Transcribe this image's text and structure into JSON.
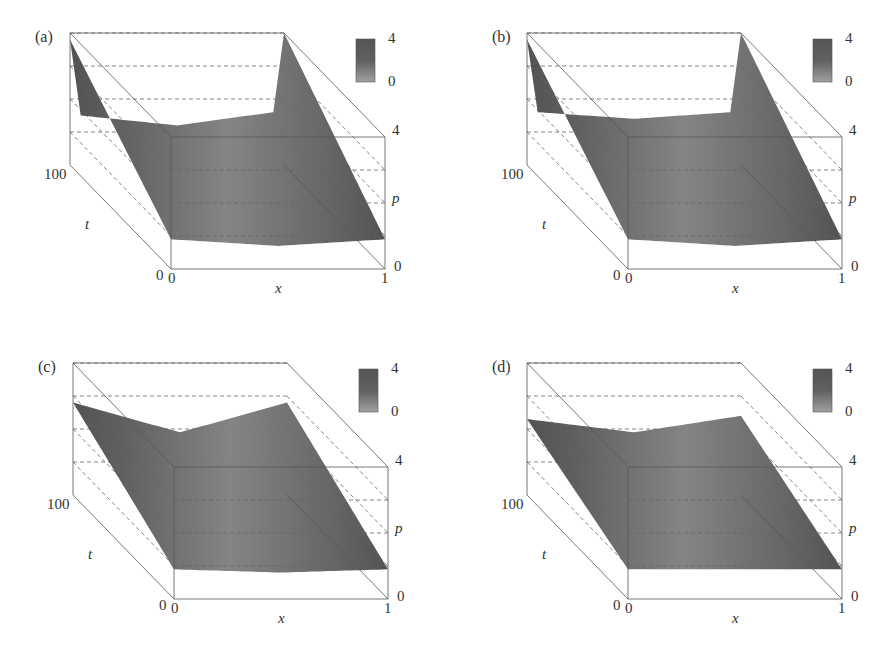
{
  "figure": {
    "panels": [
      {
        "id": "a",
        "label": "(a)",
        "left": 0,
        "top": 0
      },
      {
        "id": "b",
        "label": "(b)",
        "left": 457,
        "top": 0
      },
      {
        "id": "c",
        "label": "(c)",
        "left": 3,
        "top": 330
      },
      {
        "id": "d",
        "label": "(d)",
        "left": 457,
        "top": 330
      }
    ],
    "axes": {
      "x_label": "x",
      "x_min": "0",
      "x_max": "1",
      "t_label": "t",
      "t_min": "0",
      "t_max": "100",
      "p_label": "p",
      "p_min": "0",
      "p_max": "4",
      "colorbar_min": "0",
      "colorbar_max": "4"
    }
  },
  "chart_data": [
    {
      "type": "surface3d",
      "title": "(a)",
      "xlabel": "x",
      "ylabel": "t",
      "zlabel": "p",
      "xlim": [
        0,
        1
      ],
      "ylim": [
        0,
        100
      ],
      "zlim": [
        0,
        4
      ],
      "colorbar": {
        "min": 0,
        "max": 4
      },
      "description": "Surface p(x,t): high ridges (~4) at x=0 and x=1 decaying with t; flat low plateau (~1.2) in the interior at large t; at t=0 near-constant low value",
      "profile_t100": {
        "x": [
          0,
          0.05,
          0.5,
          0.95,
          1
        ],
        "p": [
          3.8,
          1.5,
          1.2,
          1.6,
          4.0
        ]
      },
      "profile_t0": {
        "x": [
          0,
          0.5,
          1
        ],
        "p": [
          0.9,
          0.7,
          0.9
        ]
      }
    },
    {
      "type": "surface3d",
      "title": "(b)",
      "xlabel": "x",
      "ylabel": "t",
      "zlabel": "p",
      "xlim": [
        0,
        1
      ],
      "ylim": [
        0,
        100
      ],
      "zlim": [
        0,
        4
      ],
      "colorbar": {
        "min": 0,
        "max": 4
      },
      "description": "Similar to (a), with slightly smoother boundary ridges",
      "profile_t100": {
        "x": [
          0,
          0.05,
          0.5,
          0.95,
          1
        ],
        "p": [
          3.8,
          1.6,
          1.4,
          1.6,
          4.0
        ]
      },
      "profile_t0": {
        "x": [
          0,
          0.5,
          1
        ],
        "p": [
          0.9,
          0.7,
          0.9
        ]
      }
    },
    {
      "type": "surface3d",
      "title": "(c)",
      "xlabel": "x",
      "ylabel": "t",
      "zlabel": "p",
      "xlim": [
        0,
        1
      ],
      "ylim": [
        0,
        100
      ],
      "zlim": [
        0,
        4
      ],
      "colorbar": {
        "min": 0,
        "max": 4
      },
      "description": "Smoother surface; boundary values ~2.8 at t=100 with concave interior dip to ~1.8",
      "profile_t100": {
        "x": [
          0,
          0.5,
          1
        ],
        "p": [
          2.8,
          1.9,
          2.8
        ]
      },
      "profile_t0": {
        "x": [
          0,
          0.5,
          1
        ],
        "p": [
          0.9,
          0.8,
          0.9
        ]
      }
    },
    {
      "type": "surface3d",
      "title": "(d)",
      "xlabel": "x",
      "ylabel": "t",
      "zlabel": "p",
      "xlim": [
        0,
        1
      ],
      "ylim": [
        0,
        100
      ],
      "zlim": [
        0,
        4
      ],
      "colorbar": {
        "min": 0,
        "max": 4
      },
      "description": "Smoothest case; boundary values ~2.3 at t=100 with shallow interior dip to ~1.9",
      "profile_t100": {
        "x": [
          0,
          0.5,
          1
        ],
        "p": [
          2.3,
          1.9,
          2.4
        ]
      },
      "profile_t0": {
        "x": [
          0,
          0.5,
          1
        ],
        "p": [
          0.9,
          0.9,
          0.9
        ]
      }
    }
  ]
}
